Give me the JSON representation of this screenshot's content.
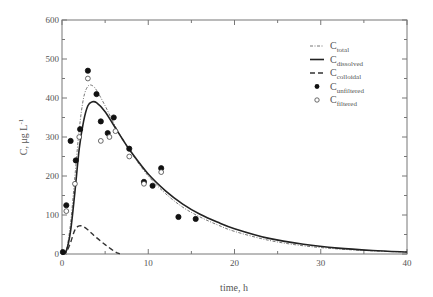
{
  "chart_data": {
    "type": "line",
    "title": "",
    "xlabel": "time, h",
    "ylabel": "C, μg L⁻¹",
    "xlim": [
      0,
      40
    ],
    "ylim": [
      0,
      600
    ],
    "xticks": [
      0,
      10,
      20,
      30,
      40
    ],
    "yticks": [
      0,
      100,
      200,
      300,
      400,
      500,
      600
    ],
    "grid": false,
    "legend_position": "upper right",
    "legend": [
      {
        "label": "C",
        "sub": "total",
        "style": "dash-dot-thin"
      },
      {
        "label": "C",
        "sub": "dissolved",
        "style": "solid"
      },
      {
        "label": "C",
        "sub": "colloidal",
        "style": "dashed"
      },
      {
        "label": "C",
        "sub": "unfiltered",
        "style": "filled-circle"
      },
      {
        "label": "C",
        "sub": "filtered",
        "style": "open-circle"
      }
    ],
    "series": [
      {
        "name": "C_total",
        "kind": "line",
        "x": [
          0,
          0.5,
          1,
          1.5,
          2,
          2.5,
          3,
          3.5,
          4,
          5,
          6,
          7,
          8,
          10,
          12,
          14,
          16,
          18,
          20,
          24,
          28,
          32,
          36,
          40
        ],
        "y": [
          0,
          10,
          80,
          200,
          320,
          400,
          430,
          432,
          420,
          380,
          335,
          295,
          260,
          200,
          155,
          120,
          95,
          75,
          58,
          35,
          21,
          13,
          8,
          5
        ]
      },
      {
        "name": "C_dissolved",
        "kind": "line",
        "x": [
          0,
          0.5,
          1,
          1.5,
          2,
          2.5,
          3,
          3.5,
          4,
          5,
          6,
          7,
          8,
          10,
          12,
          14,
          16,
          18,
          20,
          24,
          28,
          32,
          36,
          40
        ],
        "y": [
          0,
          8,
          60,
          160,
          270,
          340,
          380,
          390,
          388,
          365,
          330,
          295,
          262,
          205,
          162,
          128,
          102,
          82,
          65,
          40,
          25,
          15,
          9,
          5
        ]
      },
      {
        "name": "C_colloidal",
        "kind": "line",
        "x": [
          0,
          0.5,
          1,
          1.5,
          2,
          2.5,
          3,
          3.5,
          4,
          5,
          6,
          6.7
        ],
        "y": [
          0,
          5,
          30,
          62,
          72,
          70,
          62,
          52,
          42,
          24,
          8,
          0
        ]
      },
      {
        "name": "C_unfiltered",
        "kind": "scatter",
        "marker": "filled",
        "x": [
          0.1,
          0.5,
          1.0,
          1.6,
          2.1,
          3.0,
          4.0,
          4.5,
          5.3,
          6.0,
          7.8,
          9.5,
          10.5,
          11.5,
          13.5,
          15.5
        ],
        "y": [
          5,
          125,
          290,
          240,
          320,
          470,
          410,
          340,
          310,
          350,
          270,
          185,
          175,
          220,
          95,
          90
        ]
      },
      {
        "name": "C_filtered",
        "kind": "scatter",
        "marker": "open",
        "x": [
          0.5,
          1.5,
          2.0,
          3.0,
          4.5,
          5.5,
          6.2,
          7.8,
          9.5,
          11.5
        ],
        "y": [
          110,
          180,
          300,
          450,
          290,
          300,
          315,
          250,
          180,
          210
        ]
      }
    ]
  },
  "axes": {
    "xlabel": "time, h",
    "ylabel_main": "C, μg L",
    "ylabel_sup": "-1"
  }
}
